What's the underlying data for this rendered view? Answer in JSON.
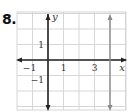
{
  "problem": {
    "number": "8."
  },
  "chart_data": {
    "type": "line",
    "title": "",
    "xlabel": "x",
    "ylabel": "y",
    "xlim": [
      -2,
      5
    ],
    "ylim": [
      -3,
      3
    ],
    "grid": true,
    "x_tick_labels": [
      {
        "value": -1,
        "text": "−1"
      },
      {
        "value": 1,
        "text": "1"
      },
      {
        "value": 3,
        "text": "3"
      }
    ],
    "y_tick_labels": [
      {
        "value": 1,
        "text": "1"
      },
      {
        "value": -1,
        "text": "−1"
      }
    ],
    "series": [
      {
        "name": "x = 4",
        "kind": "vertical-line",
        "x": 4,
        "color": "#8a8a8a"
      }
    ],
    "colors": {
      "axis": "#222222",
      "grid": "#d6d6d6",
      "series": "#8a8a8a"
    }
  }
}
